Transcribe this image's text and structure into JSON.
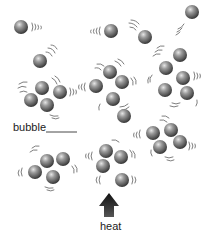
{
  "diagram": {
    "labels": {
      "bubble": "bubble",
      "heat": "heat"
    },
    "colors": {
      "sphere_light": "#d8d8d8",
      "sphere_mid": "#8a8a8a",
      "sphere_dark": "#3a3a3a",
      "motion_lines": "#6a6a6a",
      "arrow": "#1a1a1a",
      "text": "#222222"
    },
    "sphere_radius": 7,
    "single_molecules": [
      {
        "x": 21,
        "y": 27,
        "motion": "right"
      },
      {
        "x": 111,
        "y": 31,
        "motion": "left"
      },
      {
        "x": 145,
        "y": 37,
        "motion": "up-left"
      },
      {
        "x": 192,
        "y": 12,
        "motion": "down-left"
      },
      {
        "x": 40,
        "y": 61,
        "motion": "up-right"
      },
      {
        "x": 124,
        "y": 116,
        "motion": "none"
      }
    ],
    "clusters": [
      {
        "name": "top-left",
        "spheres": [
          [
            42,
            88
          ],
          [
            60,
            92
          ],
          [
            31,
            100
          ],
          [
            47,
            105
          ]
        ]
      },
      {
        "name": "center-top",
        "spheres": [
          [
            110,
            72
          ],
          [
            96,
            86
          ],
          [
            122,
            82
          ],
          [
            113,
            99
          ]
        ]
      },
      {
        "name": "top-right",
        "spheres": [
          [
            180,
            55
          ],
          [
            166,
            68
          ],
          [
            183,
            78
          ],
          [
            165,
            90
          ],
          [
            187,
            93
          ]
        ]
      },
      {
        "name": "bottom-left",
        "spheres": [
          [
            47,
            161
          ],
          [
            63,
            159
          ],
          [
            35,
            172
          ],
          [
            53,
            177
          ]
        ]
      },
      {
        "name": "center-bottom",
        "spheres": [
          [
            106,
            151
          ],
          [
            121,
            157
          ],
          [
            103,
            166
          ],
          [
            122,
            180
          ]
        ]
      },
      {
        "name": "bottom-right",
        "spheres": [
          [
            153,
            133
          ],
          [
            171,
            130
          ],
          [
            160,
            147
          ],
          [
            180,
            142
          ]
        ]
      }
    ]
  }
}
